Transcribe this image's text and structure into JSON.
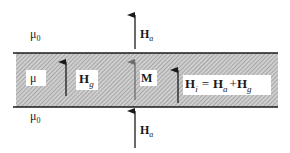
{
  "diagram": {
    "regions": {
      "top_medium": "μ",
      "top_medium_sub": "0",
      "film_medium": "μ",
      "bottom_medium": "μ",
      "bottom_medium_sub": "0"
    },
    "vectors": {
      "applied_top": {
        "symbol": "H",
        "subscript": "a"
      },
      "gap_field": {
        "symbol": "H",
        "subscript": "g"
      },
      "magnetization": {
        "symbol": "M"
      },
      "internal_field": {
        "symbol": "H",
        "subscript": "i"
      },
      "applied_bottom": {
        "symbol": "H",
        "subscript": "a"
      }
    },
    "equation": {
      "lhs_symbol": "H",
      "lhs_sub": "i",
      "equals": "=",
      "term1_symbol": "H",
      "term1_sub": "a",
      "plus": "+",
      "term2_symbol": "H",
      "term2_sub": "g"
    },
    "colors": {
      "line": "#1a1a1a",
      "hatch_bg": "#c8c8c8",
      "hatch_line": "#8a8a8a",
      "magnetization_arrow": "#6e6e6e",
      "label_bg": "#ffffff"
    }
  }
}
